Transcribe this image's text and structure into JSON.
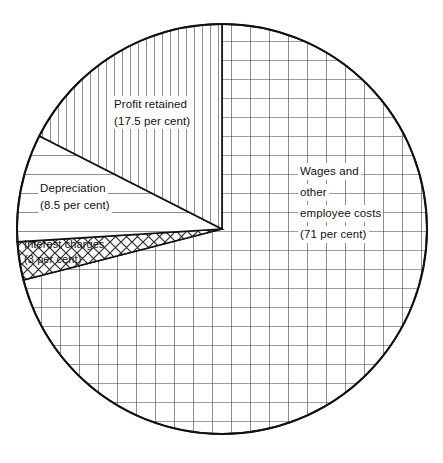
{
  "chart_data": {
    "type": "pie",
    "title": "",
    "subtitle": "",
    "xlabel": "",
    "ylabel": "",
    "legend_position": "none",
    "grid": false,
    "units": "per cent",
    "total": 100,
    "start_angle_deg": 0,
    "direction": "clockwise",
    "categories": [
      "Wages and other employee costs",
      "Interest charges",
      "Depreciation",
      "Profit retained"
    ],
    "values": [
      71,
      3,
      8.5,
      17.5
    ],
    "slices": [
      {
        "key": "wages",
        "name": "Wages and other employee costs",
        "value": 71,
        "value_text": "(71 per cent)",
        "label_lines": [
          "Wages and",
          "other",
          "employee costs",
          "(71 per cent)"
        ],
        "pattern": "square-grid",
        "start_deg": 0,
        "end_deg": 255.6,
        "sweep_deg": 255.6
      },
      {
        "key": "interest",
        "name": "Interest charges",
        "value": 3,
        "value_text": "(3 per cent)",
        "label_lines": [
          "Interest charges",
          "(3 per cent)"
        ],
        "pattern": "cross-hatch",
        "start_deg": 255.6,
        "end_deg": 266.4,
        "sweep_deg": 10.8
      },
      {
        "key": "depreciation",
        "name": "Depreciation",
        "value": 8.5,
        "value_text": "(8.5 per cent)",
        "label_lines": [
          "Depreciation",
          "(8.5 per cent)"
        ],
        "pattern": "horizontal-lines",
        "start_deg": 266.4,
        "end_deg": 297.0,
        "sweep_deg": 30.6
      },
      {
        "key": "profit",
        "name": "Profit retained",
        "value": 17.5,
        "value_text": "(17.5 per cent)",
        "label_lines": [
          "Profit retained",
          "(17.5 per cent)"
        ],
        "pattern": "vertical-lines",
        "start_deg": 297.0,
        "end_deg": 360.0,
        "sweep_deg": 63.0
      }
    ],
    "colors": {
      "stroke": "#111111",
      "fill": "#ffffff",
      "hatch": "#333333",
      "background": "#ffffff",
      "label_text": "#111111"
    },
    "geometry": {
      "cx": 222,
      "cy": 229,
      "r": 205
    }
  }
}
